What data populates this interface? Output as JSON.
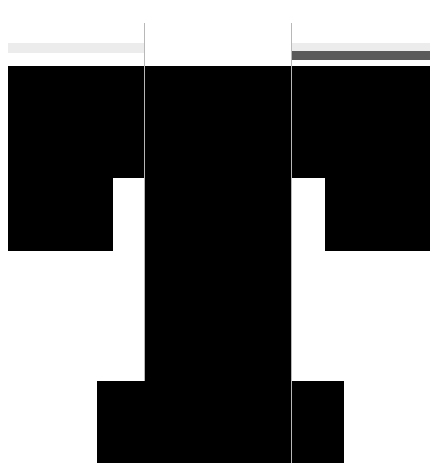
{
  "page": {
    "description": "Masked UI layout with three columns; content regions redacted",
    "colors": {
      "background": "#ffffff",
      "divider": "#b8b8b8",
      "skeleton_light": "#ececec",
      "skeleton_dark": "#5a5a5a",
      "redaction": "#000000"
    }
  },
  "columns": [
    {
      "id": "left",
      "label": ""
    },
    {
      "id": "center",
      "label": ""
    },
    {
      "id": "right",
      "label": ""
    }
  ],
  "header": {
    "left_bar": {
      "state": "loading"
    },
    "right_bar": {
      "state": "loading",
      "progress_bar": "filled"
    }
  },
  "redacted_regions": [
    {
      "id": "top-band-left"
    },
    {
      "id": "top-band-center"
    },
    {
      "id": "top-band-right"
    },
    {
      "id": "left-block"
    },
    {
      "id": "right-block"
    },
    {
      "id": "bottom-left-block"
    },
    {
      "id": "bottom-right-block"
    }
  ]
}
